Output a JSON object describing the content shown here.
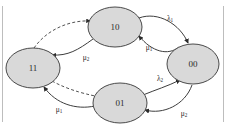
{
  "diagram": {
    "colors": {
      "node_fill": "#d9d9d9",
      "node_stroke": "#4a4a4a",
      "edge_stroke": "#3d3d3d",
      "background": "#ffffff"
    },
    "nodes": [
      {
        "id": "10",
        "label": "10",
        "cx": 115,
        "cy": 27,
        "rx": 27,
        "ry": 20
      },
      {
        "id": "00",
        "label": "00",
        "cx": 193,
        "cy": 64,
        "rx": 26,
        "ry": 20
      },
      {
        "id": "01",
        "label": "01",
        "cx": 120,
        "cy": 103,
        "rx": 27,
        "ry": 20
      },
      {
        "id": "11",
        "label": "11",
        "cx": 33,
        "cy": 68,
        "rx": 27,
        "ry": 20
      }
    ],
    "edges": [
      {
        "id": "e-10-00",
        "from": "10",
        "to": "00",
        "style": "solid",
        "label": "λ",
        "sub": "1",
        "label_x": 170,
        "label_y": 19
      },
      {
        "id": "e-00-10",
        "from": "00",
        "to": "10",
        "style": "solid",
        "label": "μ",
        "sub": "1",
        "label_x": 149,
        "label_y": 48
      },
      {
        "id": "e-00-01",
        "from": "00",
        "to": "01",
        "style": "solid",
        "label": "μ",
        "sub": "2",
        "label_x": 184,
        "label_y": 114
      },
      {
        "id": "e-01-00",
        "from": "01",
        "to": "00",
        "style": "solid",
        "label": "λ",
        "sub": "2",
        "label_x": 160,
        "label_y": 79
      },
      {
        "id": "e-01-11",
        "from": "01",
        "to": "11",
        "style": "solid",
        "label": "μ",
        "sub": "1",
        "label_x": 59,
        "label_y": 110
      },
      {
        "id": "e-11-01",
        "from": "11",
        "to": "01",
        "style": "dashed",
        "label": "",
        "sub": "",
        "label_x": 0,
        "label_y": 0
      },
      {
        "id": "e-10-11",
        "from": "10",
        "to": "11",
        "style": "solid",
        "label": "μ",
        "sub": "2",
        "label_x": 86,
        "label_y": 58
      },
      {
        "id": "e-11-10",
        "from": "11",
        "to": "10",
        "style": "dashed",
        "label": "",
        "sub": "",
        "label_x": 0,
        "label_y": 0
      }
    ]
  }
}
